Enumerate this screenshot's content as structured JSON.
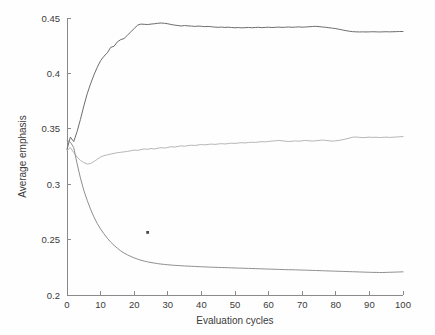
{
  "chart_data": {
    "type": "line",
    "title": "",
    "xlabel": "Evaluation cycles",
    "ylabel": "Average emphasis",
    "xlim": [
      0,
      100
    ],
    "ylim": [
      0.2,
      0.45
    ],
    "xticks": [
      0,
      10,
      20,
      30,
      40,
      50,
      60,
      70,
      80,
      90,
      100
    ],
    "xtick_labels": [
      "0",
      "10",
      "20",
      "30",
      "40",
      "50",
      "60",
      "70",
      "80",
      "90",
      "100"
    ],
    "yticks": [
      0.2,
      0.25,
      0.3,
      0.35,
      0.4,
      0.45
    ],
    "ytick_labels": [
      "0.2",
      "0.25",
      "0.3",
      "0.35",
      "0.4",
      "0.45"
    ],
    "grid": false,
    "legend": null,
    "legend_position": "none",
    "x": [
      0,
      1,
      2,
      3,
      4,
      5,
      6,
      7,
      8,
      9,
      10,
      11,
      12,
      13,
      14,
      15,
      16,
      17,
      18,
      19,
      20,
      21,
      22,
      23,
      24,
      25,
      26,
      27,
      28,
      29,
      30,
      31,
      32,
      33,
      34,
      35,
      36,
      37,
      38,
      39,
      40,
      41,
      42,
      43,
      44,
      45,
      46,
      47,
      48,
      49,
      50,
      51,
      52,
      53,
      54,
      55,
      56,
      57,
      58,
      59,
      60,
      61,
      62,
      63,
      64,
      65,
      66,
      67,
      68,
      69,
      70,
      71,
      72,
      73,
      74,
      75,
      76,
      77,
      78,
      79,
      80,
      81,
      82,
      83,
      84,
      85,
      86,
      87,
      88,
      89,
      90,
      91,
      92,
      93,
      94,
      95,
      96,
      97,
      98,
      99,
      100
    ],
    "series": [
      {
        "name": "upper",
        "color": "#6d6d6d",
        "values": [
          0.3315,
          0.3425,
          0.3385,
          0.3475,
          0.3585,
          0.3705,
          0.3815,
          0.3905,
          0.3985,
          0.4055,
          0.4115,
          0.4155,
          0.4185,
          0.4235,
          0.4245,
          0.4285,
          0.4305,
          0.4315,
          0.4345,
          0.4375,
          0.4405,
          0.4435,
          0.4445,
          0.4443,
          0.4441,
          0.4445,
          0.4448,
          0.4452,
          0.4455,
          0.4452,
          0.4448,
          0.4441,
          0.4436,
          0.4432,
          0.4428,
          0.4432,
          0.4429,
          0.4427,
          0.4424,
          0.4427,
          0.4425,
          0.4422,
          0.4424,
          0.4421,
          0.4418,
          0.4416,
          0.4418,
          0.4415,
          0.4417,
          0.4414,
          0.4412,
          0.4414,
          0.4411,
          0.4413,
          0.4415,
          0.4412,
          0.4414,
          0.4416,
          0.4413,
          0.4415,
          0.4417,
          0.4414,
          0.4416,
          0.4418,
          0.4415,
          0.4417,
          0.4419,
          0.4416,
          0.4418,
          0.442,
          0.4417,
          0.4419,
          0.4421,
          0.4423,
          0.4425,
          0.4422,
          0.4419,
          0.4416,
          0.4412,
          0.4408,
          0.4404,
          0.4398,
          0.4392,
          0.4386,
          0.4381,
          0.4377,
          0.4375,
          0.4374,
          0.4375,
          0.4374,
          0.4375,
          0.4376,
          0.4375,
          0.4374,
          0.4375,
          0.4376,
          0.4375,
          0.4376,
          0.4377,
          0.4378,
          0.4378
        ]
      },
      {
        "name": "middle",
        "color": "#b6b6b6",
        "values": [
          0.3305,
          0.333,
          0.3285,
          0.3245,
          0.3215,
          0.3195,
          0.3182,
          0.3186,
          0.3205,
          0.3225,
          0.3245,
          0.3258,
          0.3265,
          0.3272,
          0.3278,
          0.3285,
          0.3288,
          0.3292,
          0.3296,
          0.3302,
          0.3308,
          0.3305,
          0.3312,
          0.3318,
          0.3315,
          0.3322,
          0.3318,
          0.3325,
          0.333,
          0.3326,
          0.3332,
          0.3338,
          0.3335,
          0.3341,
          0.3346,
          0.3343,
          0.3348,
          0.3352,
          0.3349,
          0.3354,
          0.3358,
          0.3355,
          0.3359,
          0.3362,
          0.3359,
          0.3363,
          0.3366,
          0.3363,
          0.3367,
          0.337,
          0.3368,
          0.3372,
          0.3375,
          0.3372,
          0.3376,
          0.3379,
          0.3377,
          0.3381,
          0.3384,
          0.3382,
          0.3386,
          0.3389,
          0.3392,
          0.3395,
          0.3392,
          0.3388,
          0.3385,
          0.3388,
          0.3391,
          0.3388,
          0.3392,
          0.3395,
          0.3392,
          0.3389,
          0.3392,
          0.3395,
          0.3398,
          0.3395,
          0.3392,
          0.3389,
          0.3392,
          0.3396,
          0.3401,
          0.3408,
          0.3416,
          0.3424,
          0.3426,
          0.3423,
          0.342,
          0.3422,
          0.3425,
          0.3422,
          0.3424,
          0.3421,
          0.3423,
          0.3425,
          0.3422,
          0.3424,
          0.3426,
          0.3428,
          0.343
        ]
      },
      {
        "name": "lower",
        "color": "#8f8f8f",
        "values": [
          0.3395,
          0.338,
          0.333,
          0.3185,
          0.3055,
          0.2945,
          0.2855,
          0.2775,
          0.2705,
          0.2645,
          0.2595,
          0.2552,
          0.2512,
          0.2478,
          0.2448,
          0.2422,
          0.2398,
          0.2378,
          0.2362,
          0.2348,
          0.2335,
          0.2324,
          0.2314,
          0.2306,
          0.2299,
          0.2293,
          0.2288,
          0.2283,
          0.2279,
          0.2276,
          0.2273,
          0.227,
          0.2268,
          0.2266,
          0.2264,
          0.2262,
          0.2261,
          0.2259,
          0.2258,
          0.2256,
          0.2255,
          0.2254,
          0.2252,
          0.2251,
          0.225,
          0.2249,
          0.2248,
          0.2247,
          0.2246,
          0.2245,
          0.2244,
          0.2243,
          0.2242,
          0.2241,
          0.224,
          0.2239,
          0.2238,
          0.2237,
          0.2236,
          0.2235,
          0.2234,
          0.2233,
          0.2232,
          0.2231,
          0.223,
          0.2229,
          0.2228,
          0.2228,
          0.2227,
          0.2226,
          0.2225,
          0.2224,
          0.2223,
          0.2222,
          0.2221,
          0.222,
          0.2219,
          0.2218,
          0.2217,
          0.2216,
          0.2215,
          0.2214,
          0.2213,
          0.2212,
          0.2211,
          0.221,
          0.2209,
          0.2208,
          0.2207,
          0.2206,
          0.2205,
          0.2204,
          0.2204,
          0.2203,
          0.2203,
          0.2204,
          0.2205,
          0.2206,
          0.2207,
          0.2208,
          0.2209
        ]
      }
    ],
    "annotations": [
      {
        "name": "scan-speck",
        "x": 24,
        "y": 0.2565
      }
    ]
  }
}
